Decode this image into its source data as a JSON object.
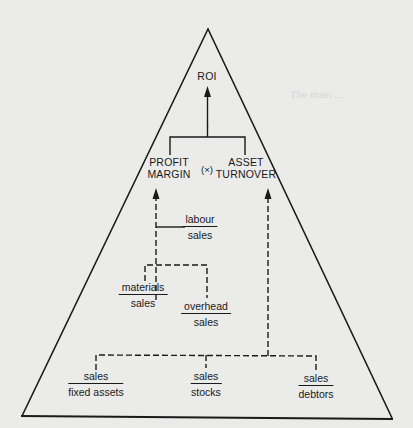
{
  "diagram": {
    "type": "ratio-pyramid",
    "colors": {
      "background": "#ebebea",
      "ink": "#1a1a1a"
    },
    "apex": {
      "label": "ROI"
    },
    "primary_ratios": {
      "left": {
        "line1": "PROFIT",
        "line2": "MARGIN"
      },
      "operator": "(×)",
      "right": {
        "line1": "ASSET",
        "line2": "TURNOVER"
      }
    },
    "profit_margin_ratios": [
      {
        "id": "labour",
        "numerator": "labour",
        "denominator": "sales"
      },
      {
        "id": "materials",
        "numerator": "materials",
        "denominator": "sales"
      },
      {
        "id": "overhead",
        "numerator": "overhead",
        "denominator": "sales"
      }
    ],
    "asset_turnover_ratios": [
      {
        "id": "fixed-assets",
        "numerator": "sales",
        "denominator": "fixed assets"
      },
      {
        "id": "stocks",
        "numerator": "sales",
        "denominator": "stocks"
      },
      {
        "id": "debtors",
        "numerator": "sales",
        "denominator": "debtors"
      }
    ]
  }
}
